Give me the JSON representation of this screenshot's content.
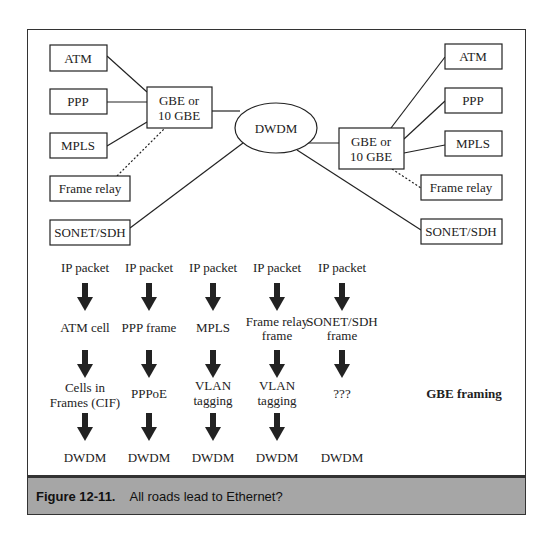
{
  "diagram": {
    "left_cluster": {
      "protocols": [
        "ATM",
        "PPP",
        "MPLS",
        "Frame relay",
        "SONET/SDH"
      ],
      "switch": [
        "GBE or",
        "10 GBE"
      ]
    },
    "core": "DWDM",
    "right_cluster": {
      "protocols": [
        "ATM",
        "PPP",
        "MPLS",
        "Frame relay",
        "SONET/SDH"
      ],
      "switch": [
        "GBE or",
        "10 GBE"
      ]
    },
    "dotted_link_protocol": "Frame relay"
  },
  "stacks": [
    {
      "layers": [
        [
          "IP packet"
        ],
        [
          "ATM cell"
        ],
        [
          "Cells in",
          "Frames (CIF)"
        ],
        [
          "DWDM"
        ]
      ],
      "arrows": 3
    },
    {
      "layers": [
        [
          "IP packet"
        ],
        [
          "PPP frame"
        ],
        [
          "PPPoE"
        ],
        [
          "DWDM"
        ]
      ],
      "arrows": 3
    },
    {
      "layers": [
        [
          "IP packet"
        ],
        [
          "MPLS"
        ],
        [
          "VLAN",
          "tagging"
        ],
        [
          "DWDM"
        ]
      ],
      "arrows": 3
    },
    {
      "layers": [
        [
          "IP packet"
        ],
        [
          "Frame relay",
          "frame"
        ],
        [
          "VLAN",
          "tagging"
        ],
        [
          "DWDM"
        ]
      ],
      "arrows": 3
    },
    {
      "layers": [
        [
          "IP packet"
        ],
        [
          "SONET/SDH",
          "frame"
        ],
        [
          "???"
        ],
        [
          "DWDM"
        ]
      ],
      "arrows": 2
    }
  ],
  "row_label": "GBE framing",
  "caption": {
    "number": "Figure 12-11.",
    "text": "All roads lead to Ethernet?"
  },
  "colors": {
    "line": "#222222",
    "caption_bg": "#a6a6a6"
  }
}
